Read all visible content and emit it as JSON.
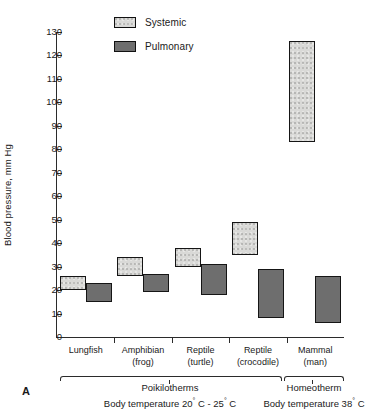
{
  "figure": {
    "panel_letter": "A",
    "ylabel": "Blood pressure, mm Hg",
    "legend": [
      {
        "label": "Systemic",
        "key": "systemic",
        "color": "#d9d9d7",
        "pattern": "stippled"
      },
      {
        "label": "Pulmonary",
        "key": "pulmonary",
        "color": "#6e6e6e",
        "pattern": "solid"
      }
    ],
    "groups": [
      {
        "name": "poikilotherms",
        "label": "Poikilotherms",
        "sublabel_pre": "Body temperature 20",
        "sublabel_deg1": "°",
        "sublabel_mid": " C - 25",
        "sublabel_deg2": "°",
        "sublabel_post": " C",
        "sublabel": "Body temperature 20° C - 25° C",
        "members": [
          "Lungfish",
          "Amphibian (frog)",
          "Reptile (turtle)",
          "Reptile (crocodile)"
        ]
      },
      {
        "name": "homeotherm",
        "label": "Homeotherm",
        "sublabel_pre": "Body temperature 38",
        "sublabel_deg1": "°",
        "sublabel_mid": "",
        "sublabel_deg2": "",
        "sublabel_post": " C",
        "sublabel": "Body temperature 38° C",
        "members": [
          "Mammal (man)"
        ]
      }
    ]
  },
  "chart_data": {
    "type": "bar",
    "subtype": "floating-range-bar",
    "title": "",
    "xlabel": "",
    "ylabel": "Blood pressure, mm Hg",
    "ylim": [
      0,
      130
    ],
    "yticks": [
      0,
      10,
      20,
      30,
      40,
      50,
      60,
      70,
      80,
      90,
      100,
      110,
      120,
      130
    ],
    "ytick_labels": [
      "0",
      "10",
      "20",
      "30",
      "40",
      "50",
      "60",
      "70",
      "80",
      "90",
      "100",
      "110",
      "120",
      "130"
    ],
    "grid": false,
    "legend_position": "top-left",
    "categories": [
      "Lungfish",
      "Amphibian (frog)",
      "Reptile (turtle)",
      "Reptile (crocodile)",
      "Mammal (man)"
    ],
    "category_lines": [
      [
        "Lungfish",
        ""
      ],
      [
        "Amphibian",
        "(frog)"
      ],
      [
        "Reptile",
        "(turtle)"
      ],
      [
        "Reptile",
        "(crocodile)"
      ],
      [
        "Mammal",
        "(man)"
      ]
    ],
    "series": [
      {
        "name": "Systemic",
        "color": "#d9d9d7",
        "ranges": [
          {
            "category": "Lungfish",
            "low": 20,
            "high": 26
          },
          {
            "category": "Amphibian (frog)",
            "low": 26,
            "high": 34
          },
          {
            "category": "Reptile (turtle)",
            "low": 30,
            "high": 38
          },
          {
            "category": "Reptile (crocodile)",
            "low": 35,
            "high": 49
          },
          {
            "category": "Mammal (man)",
            "low": 83,
            "high": 126
          }
        ]
      },
      {
        "name": "Pulmonary",
        "color": "#6e6e6e",
        "ranges": [
          {
            "category": "Lungfish",
            "low": 15,
            "high": 23
          },
          {
            "category": "Amphibian (frog)",
            "low": 19,
            "high": 27
          },
          {
            "category": "Reptile (turtle)",
            "low": 18,
            "high": 31
          },
          {
            "category": "Reptile (crocodile)",
            "low": 8,
            "high": 29
          },
          {
            "category": "Mammal (man)",
            "low": 6,
            "high": 26
          }
        ]
      }
    ]
  }
}
